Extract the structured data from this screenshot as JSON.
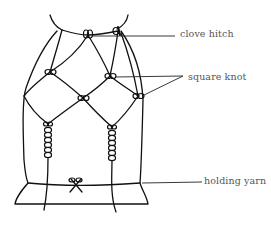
{
  "diagram": {
    "type": "macrame knotting illustration",
    "colors": {
      "line": "#111111",
      "label_text": "#555555",
      "background": "#ffffff"
    },
    "labels": [
      {
        "id": "clove-hitch",
        "text": "clove hitch"
      },
      {
        "id": "square-knot",
        "text": "square knot"
      },
      {
        "id": "holding-yarn",
        "text": "holding yarn"
      }
    ]
  }
}
